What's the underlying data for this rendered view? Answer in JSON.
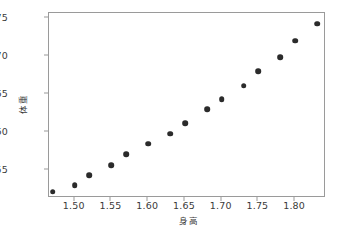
{
  "figure": {
    "background_color": "#ffffff",
    "frame_color": "#9a9a9a",
    "marker_color": "#2b2b2b",
    "tick_text_color": "#3a3a3a"
  },
  "chart_data": {
    "type": "scatter",
    "title": "",
    "xlabel": "身高",
    "ylabel": "体重",
    "xlim": [
      1.465,
      1.842
    ],
    "ylim": [
      51.4,
      75.6
    ],
    "grid": false,
    "legend": null,
    "xticks": [
      1.5,
      1.55,
      1.6,
      1.65,
      1.7,
      1.75,
      1.8
    ],
    "xtick_labels": [
      "1.50",
      "1.55",
      "1.60",
      "1.65",
      "1.70",
      "1.75",
      "1.80"
    ],
    "yticks": [
      55,
      60,
      65,
      70,
      75
    ],
    "ytick_labels": [
      "55",
      "60",
      "65",
      "70",
      "75"
    ],
    "x": [
      1.47,
      1.5,
      1.52,
      1.55,
      1.57,
      1.6,
      1.63,
      1.65,
      1.68,
      1.7,
      1.73,
      1.75,
      1.78,
      1.8,
      1.83
    ],
    "y": [
      52.2,
      53.1,
      54.4,
      55.7,
      57.1,
      58.5,
      59.8,
      61.2,
      63.0,
      64.3,
      66.1,
      68.0,
      69.8,
      72.0,
      74.2
    ],
    "points": [
      {
        "x": 1.47,
        "y": 52.2
      },
      {
        "x": 1.5,
        "y": 53.1
      },
      {
        "x": 1.52,
        "y": 54.4
      },
      {
        "x": 1.55,
        "y": 55.7
      },
      {
        "x": 1.57,
        "y": 57.1
      },
      {
        "x": 1.6,
        "y": 58.5
      },
      {
        "x": 1.63,
        "y": 59.8
      },
      {
        "x": 1.65,
        "y": 61.2
      },
      {
        "x": 1.68,
        "y": 63.0
      },
      {
        "x": 1.7,
        "y": 64.3
      },
      {
        "x": 1.73,
        "y": 66.1
      },
      {
        "x": 1.75,
        "y": 68.0
      },
      {
        "x": 1.78,
        "y": 69.8
      },
      {
        "x": 1.8,
        "y": 72.0
      },
      {
        "x": 1.83,
        "y": 74.2
      }
    ]
  }
}
